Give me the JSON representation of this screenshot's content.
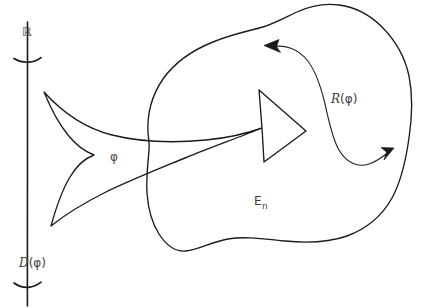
{
  "figure": {
    "type": "hand-drawn-mathematical-diagram",
    "background_color": "#ffffff",
    "ink_color": "#1b1b1b",
    "label_color": "#3c3c3c",
    "width": 425,
    "height": 308
  },
  "axis": {
    "name": "real-line",
    "label_top": "ℝ",
    "label_bottom_prefix": "𝒟",
    "label_bottom": "𝒟(φ)",
    "label_bottom_paren_open": "(",
    "label_bottom_arg": "φ",
    "label_bottom_paren_close": ")",
    "tick_count": 2
  },
  "labels": {
    "real_line": "ℝ",
    "domain": "D",
    "domain_open": "(",
    "domain_arg": "φ",
    "domain_close": ")",
    "arrow_map": "φ",
    "range_prefix": "R",
    "range_open": "(",
    "range_arg": "φ",
    "range_close": ")",
    "space_base": "E",
    "space_sub": "n"
  },
  "elements": [
    {
      "name": "real-line-axis",
      "kind": "line"
    },
    {
      "name": "axis-tick-upper",
      "kind": "tick"
    },
    {
      "name": "axis-tick-lower",
      "kind": "tick"
    },
    {
      "name": "blob-region",
      "kind": "closed-curve"
    },
    {
      "name": "block-arrow",
      "kind": "outlined-arrow"
    },
    {
      "name": "s-curve-double-arrow",
      "kind": "curve-with-two-arrowheads"
    }
  ]
}
